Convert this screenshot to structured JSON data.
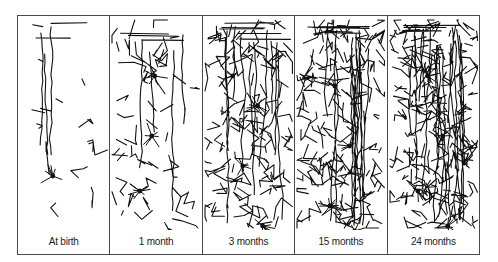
{
  "figure": {
    "stroke_color": "#111111",
    "border_color": "#4a4a4a",
    "panels": [
      {
        "label": "At birth",
        "density": 14,
        "seed": 3,
        "neurons": [
          [
            35,
            160
          ],
          [
            28,
            235
          ]
        ]
      },
      {
        "label": "1 month",
        "density": 46,
        "seed": 11,
        "neurons": [
          [
            45,
            60
          ],
          [
            42,
            120
          ],
          [
            30,
            175
          ],
          [
            60,
            215
          ]
        ]
      },
      {
        "label": "3 months",
        "density": 115,
        "seed": 23,
        "neurons": [
          [
            30,
            60
          ],
          [
            55,
            90
          ],
          [
            40,
            150
          ],
          [
            60,
            210
          ]
        ]
      },
      {
        "label": "15 months",
        "density": 140,
        "seed": 37,
        "neurons": [
          [
            40,
            70
          ],
          [
            55,
            130
          ],
          [
            35,
            190
          ],
          [
            60,
            215
          ]
        ]
      },
      {
        "label": "24 months",
        "density": 175,
        "seed": 51,
        "neurons": [
          [
            40,
            60
          ],
          [
            55,
            120
          ],
          [
            30,
            175
          ],
          [
            60,
            210
          ]
        ]
      }
    ]
  }
}
